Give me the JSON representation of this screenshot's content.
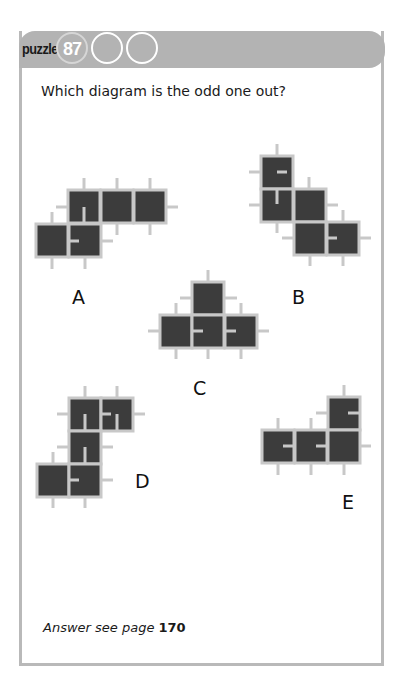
{
  "header": {
    "word": "puzzle",
    "number": "87"
  },
  "question": "Which diagram is the odd one out?",
  "answer": {
    "prefix": "Answer see page",
    "page": "170"
  },
  "colors": {
    "header_bg": "#b3b3b3",
    "border": "#b9b9b9",
    "square_fill": "#3c3c3c",
    "square_stroke": "#c8c8c8",
    "stub": "#c8c8c8"
  },
  "diagrams": [
    {
      "label": "A",
      "label_pos": [
        72,
        286
      ],
      "squares": [
        [
          68,
          190
        ],
        [
          101,
          190
        ],
        [
          134,
          190
        ],
        [
          36,
          224
        ],
        [
          69,
          224
        ]
      ],
      "stubs": [
        [
          84,
          178,
          84,
          190
        ],
        [
          117,
          178,
          117,
          190
        ],
        [
          150,
          178,
          150,
          190
        ],
        [
          56,
          207,
          68,
          207
        ],
        [
          166,
          207,
          178,
          207
        ],
        [
          117,
          223,
          117,
          235
        ],
        [
          150,
          223,
          150,
          235
        ],
        [
          52,
          212,
          52,
          224
        ],
        [
          101,
          241,
          113,
          241
        ],
        [
          52,
          257,
          52,
          269
        ],
        [
          85,
          257,
          85,
          269
        ]
      ],
      "inner": [
        [
          84,
          207,
          84,
          223
        ],
        [
          69,
          241,
          79,
          241
        ]
      ]
    },
    {
      "label": "B",
      "label_pos": [
        292,
        286
      ],
      "squares": [
        [
          261,
          156
        ],
        [
          261,
          189
        ],
        [
          294,
          189
        ],
        [
          294,
          222
        ],
        [
          327,
          222
        ]
      ],
      "stubs": [
        [
          277,
          144,
          277,
          156
        ],
        [
          249,
          172,
          261,
          172
        ],
        [
          309,
          177,
          309,
          189
        ],
        [
          249,
          205,
          261,
          205
        ],
        [
          326,
          205,
          338,
          205
        ],
        [
          343,
          210,
          343,
          222
        ],
        [
          277,
          221,
          277,
          233
        ],
        [
          282,
          238,
          294,
          238
        ],
        [
          359,
          238,
          371,
          238
        ],
        [
          310,
          254,
          310,
          266
        ],
        [
          343,
          254,
          343,
          266
        ]
      ],
      "inner": [
        [
          277,
          172,
          287,
          172
        ],
        [
          277,
          189,
          277,
          204
        ],
        [
          327,
          238,
          337,
          238
        ]
      ]
    },
    {
      "label": "C",
      "label_pos": [
        193,
        377
      ],
      "squares": [
        [
          192,
          282
        ],
        [
          160,
          315
        ],
        [
          192,
          315
        ],
        [
          225,
          315
        ]
      ],
      "stubs": [
        [
          208,
          270,
          208,
          282
        ],
        [
          180,
          298,
          192,
          298
        ],
        [
          225,
          298,
          237,
          298
        ],
        [
          176,
          303,
          176,
          315
        ],
        [
          241,
          303,
          241,
          315
        ],
        [
          148,
          331,
          160,
          331
        ],
        [
          257,
          331,
          269,
          331
        ],
        [
          176,
          347,
          176,
          359
        ],
        [
          208,
          347,
          208,
          359
        ],
        [
          241,
          347,
          241,
          359
        ]
      ],
      "inner": [
        [
          192,
          331,
          203,
          331
        ],
        [
          225,
          331,
          236,
          331
        ]
      ]
    },
    {
      "label": "D",
      "label_pos": [
        135,
        470
      ],
      "squares": [
        [
          69,
          398
        ],
        [
          101,
          398
        ],
        [
          69,
          431
        ],
        [
          37,
          464
        ],
        [
          69,
          464
        ]
      ],
      "stubs": [
        [
          85,
          386,
          85,
          398
        ],
        [
          117,
          386,
          117,
          398
        ],
        [
          57,
          414,
          69,
          414
        ],
        [
          133,
          414,
          145,
          414
        ],
        [
          57,
          447,
          69,
          447
        ],
        [
          101,
          447,
          113,
          447
        ],
        [
          53,
          452,
          53,
          464
        ],
        [
          101,
          480,
          113,
          480
        ],
        [
          53,
          496,
          53,
          508
        ],
        [
          85,
          496,
          85,
          508
        ]
      ],
      "inner": [
        [
          85,
          414,
          85,
          430
        ],
        [
          101,
          414,
          111,
          414
        ],
        [
          117,
          414,
          117,
          430
        ],
        [
          85,
          447,
          85,
          463
        ],
        [
          69,
          480,
          79,
          480
        ]
      ]
    },
    {
      "label": "E",
      "label_pos": [
        342,
        491
      ],
      "squares": [
        [
          328,
          397
        ],
        [
          262,
          430
        ],
        [
          295,
          430
        ],
        [
          328,
          430
        ]
      ],
      "stubs": [
        [
          344,
          385,
          344,
          397
        ],
        [
          316,
          413,
          328,
          413
        ],
        [
          278,
          418,
          278,
          430
        ],
        [
          311,
          418,
          311,
          430
        ],
        [
          359,
          446,
          371,
          446
        ],
        [
          278,
          463,
          278,
          475
        ],
        [
          311,
          463,
          311,
          475
        ],
        [
          344,
          463,
          344,
          475
        ]
      ],
      "inner": [
        [
          359,
          413,
          348,
          413
        ],
        [
          294,
          446,
          283,
          446
        ],
        [
          327,
          446,
          316,
          446
        ]
      ]
    }
  ]
}
